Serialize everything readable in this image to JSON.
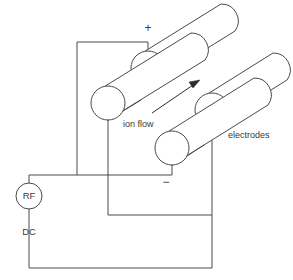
{
  "figure": {
    "canvas": {
      "width": 293,
      "height": 280
    },
    "background_color": "#ffffff",
    "line_color": "#4a4a4a",
    "text_color": "#3a3a3a"
  },
  "labels": {
    "plus": "+",
    "minus": "−",
    "ion_flow": "ion flow",
    "electrodes": "electrodes",
    "rf": "RF",
    "dc": "DC"
  },
  "components": {
    "rods": [
      {
        "name": "rod-top-positive",
        "polarity": "+",
        "cap_center": [
          148,
          68
        ],
        "cap_radius": 17
      },
      {
        "name": "rod-left-middle",
        "polarity": "",
        "cap_center": [
          108,
          103
        ],
        "cap_radius": 17
      },
      {
        "name": "rod-right-upper",
        "polarity": "",
        "cap_center": [
          212,
          110
        ],
        "cap_radius": 17
      },
      {
        "name": "rod-bottom-negative",
        "polarity": "−",
        "cap_center": [
          172,
          148
        ],
        "cap_radius": 17
      }
    ],
    "source": {
      "name": "rf-dc-supply",
      "center": [
        29,
        196
      ],
      "radius": 13
    },
    "ion_flow_arrow": {
      "from": [
        152,
        113
      ],
      "to": [
        198,
        81
      ]
    }
  }
}
